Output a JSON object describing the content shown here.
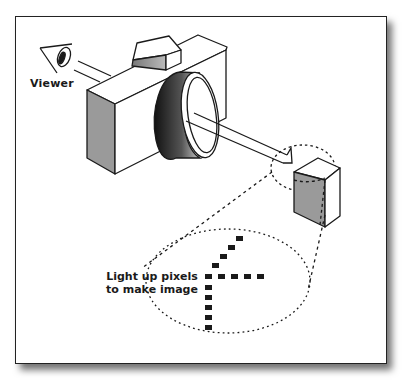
{
  "diagram": {
    "labels": {
      "viewer": "Viewer",
      "pixels_line1": "Light up pixels",
      "pixels_line2": "to make image"
    },
    "elements": [
      "eye",
      "camera",
      "lens",
      "light-ray-arrow",
      "pixel-cube",
      "magnify-circle",
      "magnified-ellipse",
      "pixel-grid"
    ],
    "colors": {
      "stroke": "#1a1a1a",
      "face_shade": "#9a9a9a",
      "pixel": "#1a1a1a",
      "background": "#ffffff"
    },
    "pixels": {
      "diagonal": [
        [
          236,
          238
        ],
        [
          228,
          247
        ],
        [
          220,
          256
        ],
        [
          212,
          265
        ]
      ],
      "horizontal": [
        [
          210,
          274
        ],
        [
          222,
          274
        ],
        [
          234,
          274
        ],
        [
          246,
          274
        ],
        [
          258,
          274
        ]
      ],
      "vertical": [
        [
          210,
          284
        ],
        [
          210,
          294
        ],
        [
          210,
          304
        ],
        [
          210,
          314
        ],
        [
          210,
          324
        ]
      ]
    }
  }
}
